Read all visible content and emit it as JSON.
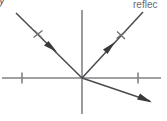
{
  "diagram": {
    "kind": "optics-ray-diagram",
    "background_color": "#ffffff",
    "axis_color": "#808285",
    "ray_color": "#4b4b4f",
    "label_color": "#6a6a6e",
    "labels": {
      "y_axis": "y",
      "reflected_ray": "reflec"
    },
    "axes": {
      "origin": {
        "x": 82,
        "y": 78
      },
      "x_axis": {
        "x1": 2,
        "y1": 78,
        "x2": 161,
        "y2": 78
      },
      "y_axis": {
        "x1": 82,
        "y1": 10,
        "x2": 82,
        "y2": 114
      },
      "ticks": [
        {
          "name": "x-tick-left",
          "x": 22,
          "y": 78
        },
        {
          "name": "x-tick-right",
          "x": 138,
          "y": 78
        }
      ]
    },
    "rays": [
      {
        "name": "incident-ray",
        "from": {
          "x": 16,
          "y": 13
        },
        "to": {
          "x": 82,
          "y": 78
        },
        "arrow_at": {
          "x": 52,
          "y": 47
        },
        "direction": "down-right",
        "tick_at": {
          "x": 38,
          "y": 34
        }
      },
      {
        "name": "reflected-ray",
        "from": {
          "x": 82,
          "y": 78
        },
        "to": {
          "x": 143,
          "y": 12
        },
        "arrow_at": {
          "x": 110,
          "y": 47
        },
        "direction": "up-right",
        "tick_at": {
          "x": 121,
          "y": 35
        }
      },
      {
        "name": "refracted-ray",
        "from": {
          "x": 82,
          "y": 78
        },
        "to": {
          "x": 150,
          "y": 101
        },
        "arrow_at": {
          "x": 148,
          "y": 100
        },
        "direction": "down-right",
        "tick_at": null
      }
    ]
  }
}
